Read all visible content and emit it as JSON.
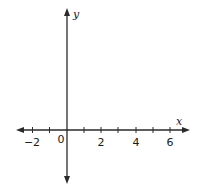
{
  "diagram": {
    "type": "coordinate-plane",
    "axes": {
      "x_label": "x",
      "y_label": "y",
      "color": "#2a2a2a"
    },
    "x_ticks": [
      -2,
      -1,
      1,
      2,
      3,
      4,
      5,
      6
    ],
    "x_tick_labels": [
      {
        "value": -2,
        "text": "−2"
      },
      {
        "value": 0,
        "text": "0"
      },
      {
        "value": 2,
        "text": "2"
      },
      {
        "value": 4,
        "text": "4"
      },
      {
        "value": 6,
        "text": "6"
      }
    ],
    "x_range": [
      -2.8,
      7
    ],
    "grid": false
  }
}
